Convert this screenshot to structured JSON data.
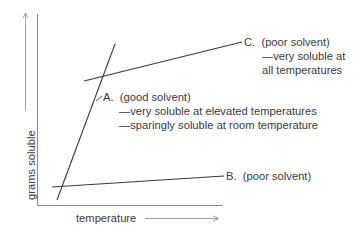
{
  "diagram": {
    "x_axis_label": "temperature",
    "y_axis_label": "grams soluble",
    "curves": [
      {
        "id": "A",
        "letter": "A.",
        "title": "(good solvent)",
        "notes": [
          "—very soluble at elevated temperatures",
          "—sparingly soluble at room temperature"
        ]
      },
      {
        "id": "B",
        "letter": "B.",
        "title": "(poor solvent)",
        "notes": []
      },
      {
        "id": "C",
        "letter": "C.",
        "title": "(poor solvent)",
        "notes": [
          "—very soluble at",
          "all temperatures"
        ]
      }
    ],
    "colors": {
      "line": "#3a3a3a",
      "axis": "#8a8a8a",
      "text": "#3a3a3a"
    }
  }
}
